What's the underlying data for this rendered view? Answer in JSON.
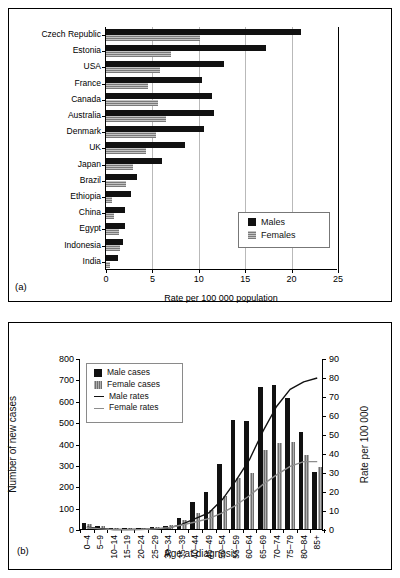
{
  "panel_a": {
    "label": "(a)",
    "legend": [
      {
        "name": "Males",
        "color": "#111111"
      },
      {
        "name": "Females",
        "color": "#7a7a7a"
      }
    ],
    "chart_data": {
      "type": "bar",
      "orientation": "horizontal",
      "title": "",
      "xlabel": "Rate per 100 000 population",
      "ylabel": "",
      "xlim": [
        0,
        25
      ],
      "xticks": [
        0,
        5,
        10,
        15,
        20,
        25
      ],
      "grid": "vertical",
      "legend_position": "inside-right",
      "categories": [
        "Czech Republic",
        "Estonia",
        "USA",
        "France",
        "Canada",
        "Australia",
        "Denmark",
        "UK",
        "Japan",
        "Brazil",
        "Ethiopia",
        "China",
        "Egypt",
        "Indonesia",
        "India"
      ],
      "series": [
        {
          "name": "Males",
          "values": [
            21.0,
            17.2,
            12.7,
            10.3,
            11.4,
            11.6,
            10.6,
            8.5,
            6.0,
            3.3,
            2.7,
            2.0,
            2.0,
            1.8,
            1.3
          ]
        },
        {
          "name": "Females",
          "values": [
            10.1,
            7.0,
            5.8,
            4.5,
            5.6,
            6.5,
            5.4,
            4.3,
            2.9,
            2.2,
            0.6,
            0.9,
            1.4,
            1.5,
            0.4
          ]
        }
      ]
    }
  },
  "panel_b": {
    "label": "(b)",
    "legend": [
      {
        "name": "Male cases",
        "kind": "swatch",
        "color": "#111111"
      },
      {
        "name": "Female cases",
        "kind": "swatch",
        "color": "#6f6f6f"
      },
      {
        "name": "Male rates",
        "kind": "line",
        "color": "#111111"
      },
      {
        "name": "Female rates",
        "kind": "line",
        "color": "#8d8d8d"
      }
    ],
    "chart_data": {
      "type": "bar",
      "title": "",
      "xlabel": "Age at diagnosis",
      "ylabel": "Number of new cases",
      "y2label": "Rate per 100 000",
      "ylim": [
        0,
        800
      ],
      "yticks": [
        0,
        100,
        200,
        300,
        400,
        500,
        600,
        700,
        800
      ],
      "y2lim": [
        0,
        90
      ],
      "y2ticks": [
        0,
        10,
        20,
        30,
        40,
        50,
        60,
        70,
        80,
        90
      ],
      "grid": "off",
      "legend_position": "top-left-inside",
      "categories": [
        "0–4",
        "5–9",
        "10–14",
        "15–19",
        "20–24",
        "25–29",
        "30–34",
        "35–39",
        "40–44",
        "45–49",
        "50–54",
        "55–59",
        "60–64",
        "65–69",
        "70–74",
        "75–79",
        "80–84",
        "85+"
      ],
      "series": [
        {
          "name": "Male cases",
          "axis": "left",
          "type": "bar",
          "values": [
            30,
            16,
            5,
            5,
            6,
            8,
            14,
            51,
            128,
            175,
            305,
            508,
            503,
            663,
            672,
            612,
            454,
            267
          ]
        },
        {
          "name": "Female cases",
          "axis": "left",
          "type": "bar",
          "values": [
            22,
            13,
            4,
            4,
            5,
            9,
            18,
            44,
            75,
            90,
            156,
            238,
            264,
            370,
            404,
            409,
            346,
            288
          ]
        },
        {
          "name": "Male rates",
          "axis": "right",
          "type": "line",
          "values": [
            1.5,
            0.8,
            0.3,
            0.3,
            0.4,
            0.6,
            1.0,
            3.0,
            6.0,
            9.0,
            16.0,
            26.0,
            37.0,
            52.0,
            65.0,
            74.0,
            78.0,
            80.0
          ]
        },
        {
          "name": "Female rates",
          "axis": "right",
          "type": "line",
          "values": [
            1.2,
            0.6,
            0.2,
            0.2,
            0.3,
            0.6,
            1.2,
            2.6,
            4.2,
            6.0,
            9.0,
            13.0,
            18.0,
            24.0,
            29.0,
            33.5,
            36.0,
            36.0
          ]
        }
      ]
    }
  }
}
